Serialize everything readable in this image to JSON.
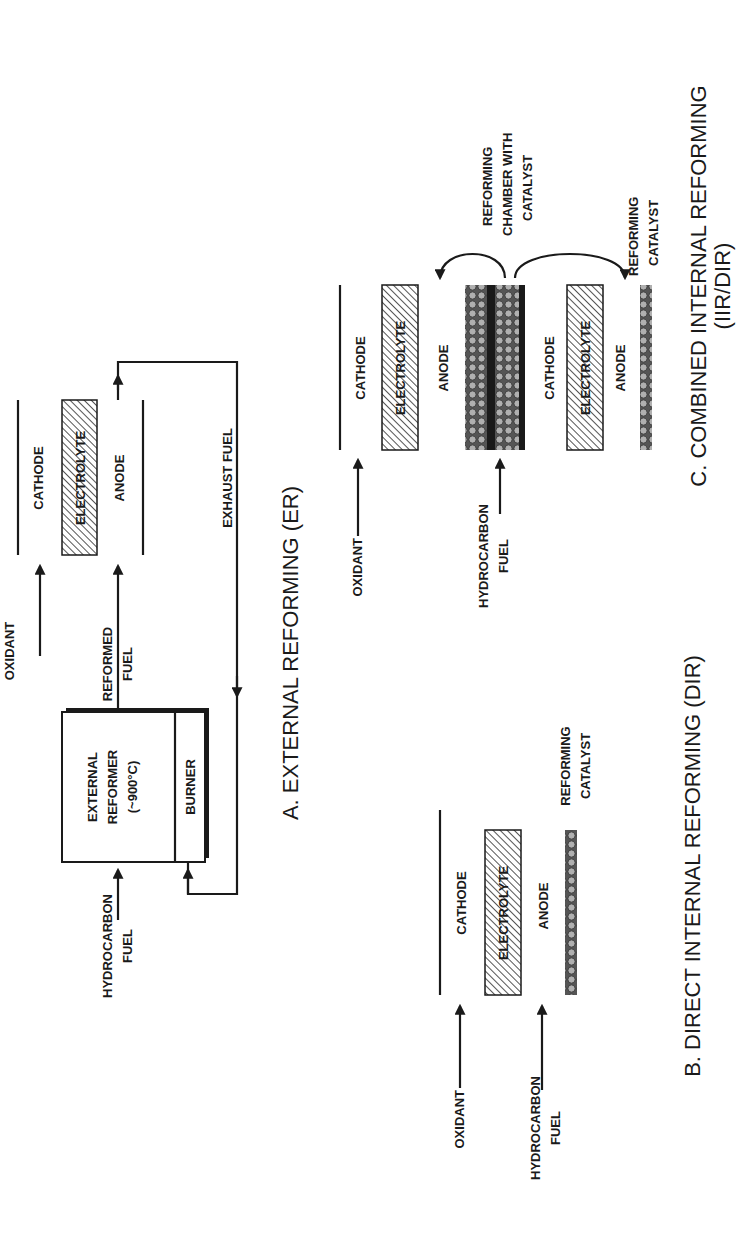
{
  "figure": {
    "orientation": "rotated 90° counter-clockwise",
    "colors": {
      "ink": "#1a1a1a",
      "background": "#ffffff",
      "catalyst": "#9a9a9a"
    },
    "panel_a": {
      "title": "A. EXTERNAL REFORMING (ER)",
      "oxidant": "OXIDANT",
      "cathode": "CATHODE",
      "electrolyte": "ELECTROLYTE",
      "anode": "ANODE",
      "reformed_fuel_1": "REFORMED",
      "reformed_fuel_2": "FUEL",
      "exhaust_fuel": "EXHAUST FUEL",
      "reformer_1": "EXTERNAL",
      "reformer_2": "REFORMER",
      "reformer_3": "(~900°C)",
      "burner": "BURNER",
      "hc_fuel_1": "HYDROCARBON",
      "hc_fuel_2": "FUEL"
    },
    "panel_b": {
      "title": "B. DIRECT INTERNAL REFORMING (DIR)",
      "oxidant": "OXIDANT",
      "cathode": "CATHODE",
      "electrolyte": "ELECTROLYTE",
      "anode": "ANODE",
      "hc_fuel_1": "HYDROCARBON",
      "hc_fuel_2": "FUEL",
      "catalyst_1": "REFORMING",
      "catalyst_2": "CATALYST"
    },
    "panel_c": {
      "title_1": "C. COMBINED INTERNAL REFORMING",
      "title_2": "(IIR/DIR)",
      "oxidant": "OXIDANT",
      "cathode_1": "CATHODE",
      "electrolyte_1": "ELECTROLYTE",
      "anode_1": "ANODE",
      "cathode_2": "CATHODE",
      "electrolyte_2": "ELECTROLYTE",
      "anode_2": "ANODE",
      "hc_fuel_1": "HYDROCARBON",
      "hc_fuel_2": "FUEL",
      "chamber_1": "REFORMING",
      "chamber_2": "CHAMBER WITH",
      "chamber_3": "CATALYST",
      "catalyst_1": "REFORMING",
      "catalyst_2": "CATALYST"
    }
  }
}
